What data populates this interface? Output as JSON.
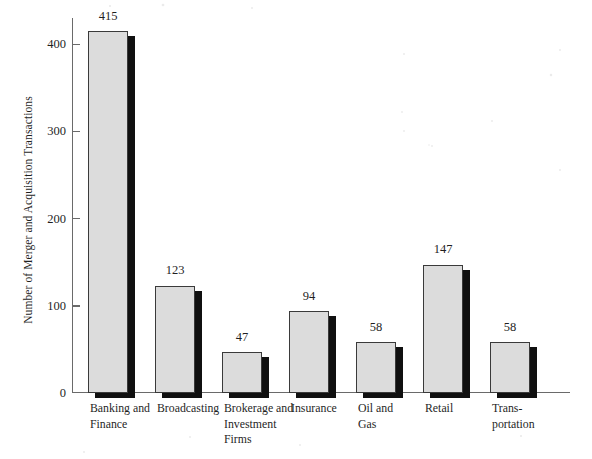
{
  "chart_data": {
    "type": "bar",
    "title": "",
    "subtitle": "",
    "xlabel": "",
    "ylabel": "Number of Merger and Acquisition Transactions",
    "categories": [
      "Banking and Finance",
      "Broadcasting",
      "Brokerage and Investment Firms",
      "Insurance",
      "Oil and Gas",
      "Retail",
      "Trans-portation"
    ],
    "category_lines": [
      [
        "Banking and",
        "Finance"
      ],
      [
        "Broadcasting"
      ],
      [
        "Brokerage and",
        "Investment",
        "Firms"
      ],
      [
        "Insurance"
      ],
      [
        "Oil and",
        "Gas"
      ],
      [
        "Retail"
      ],
      [
        "Trans-",
        "portation"
      ]
    ],
    "values": [
      415,
      123,
      47,
      94,
      58,
      147,
      58
    ],
    "data_labels": [
      "415",
      "123",
      "47",
      "94",
      "58",
      "147",
      "58"
    ],
    "ylim": [
      0,
      430
    ],
    "yticks": [
      0,
      100,
      200,
      300,
      400
    ],
    "ytick_labels": [
      "0",
      "100",
      "200",
      "300",
      "400"
    ],
    "grid": false,
    "legend": null,
    "legend_position": "none",
    "bar_fill_color": "#dcdcdc",
    "bar_edge_color": "#3a3a3a",
    "bar_shadow_color": "#101010",
    "axis_color": "#6a6a6a",
    "background_color": "#ffffff",
    "text_color": "#1f1f1f"
  }
}
